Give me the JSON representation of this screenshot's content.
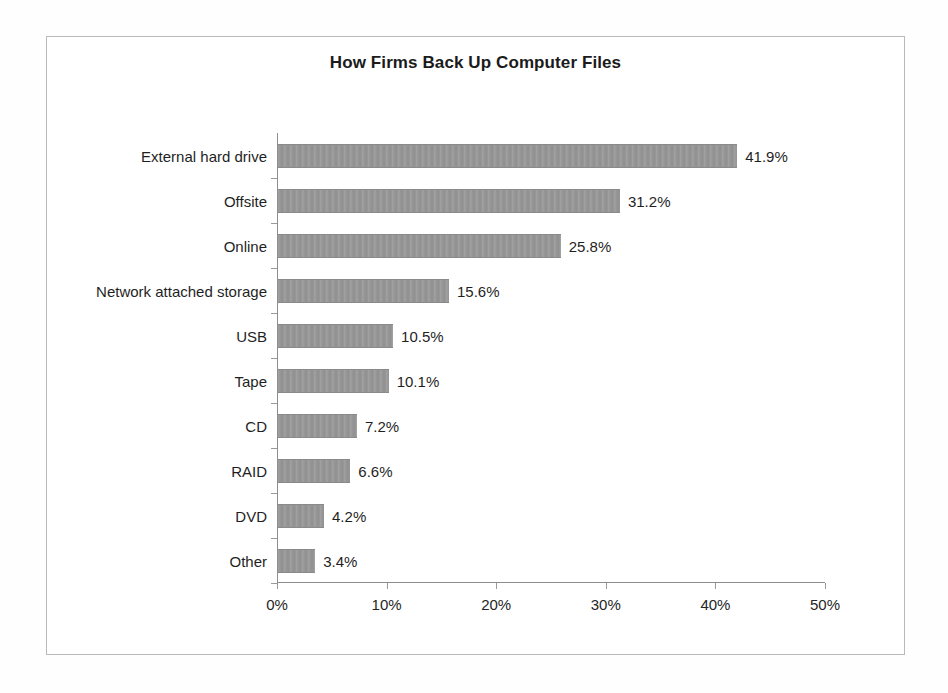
{
  "chart_data": {
    "type": "bar",
    "orientation": "horizontal",
    "title": "How Firms Back Up Computer Files",
    "xlabel": "",
    "ylabel": "",
    "xlim": [
      0,
      50
    ],
    "xticks": [
      "0%",
      "10%",
      "20%",
      "30%",
      "40%",
      "50%"
    ],
    "xtick_values": [
      0,
      10,
      20,
      30,
      40,
      50
    ],
    "grid": false,
    "legend": null,
    "value_suffix": "%",
    "categories": [
      "External hard drive",
      "Offsite",
      "Online",
      "Network attached storage",
      "USB",
      "Tape",
      "CD",
      "RAID",
      "DVD",
      "Other"
    ],
    "values": [
      41.9,
      31.2,
      25.8,
      15.6,
      10.5,
      10.1,
      7.2,
      6.6,
      4.2,
      3.4
    ],
    "value_labels": [
      "41.9%",
      "31.2%",
      "25.8%",
      "15.6%",
      "10.5%",
      "10.1%",
      "7.2%",
      "6.6%",
      "4.2%",
      "3.4%"
    ],
    "bar_color": "#989898",
    "axis_color": "#8d8d8d",
    "text_color": "#1f1f1f",
    "background_color": "#ffffff",
    "frame_color": "#b9b9b9"
  }
}
